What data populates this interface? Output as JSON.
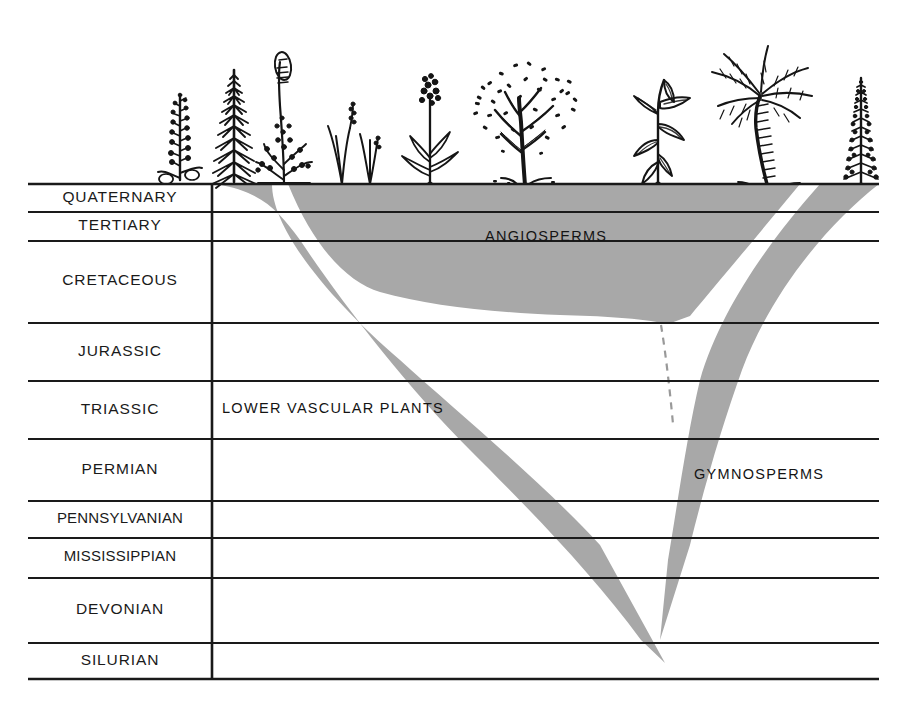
{
  "figure": {
    "kind": "geologic-time-plant-evolution-diagram",
    "background_color": "#ffffff",
    "band_color": "#a8a8a8",
    "line_color": "#1a1a1a",
    "frame": {
      "left": 28,
      "right": 879,
      "top": 183,
      "bottom": 679,
      "divider_x": 212
    }
  },
  "periods": [
    {
      "name": "QUATERNARY",
      "top": 183,
      "bottom": 212
    },
    {
      "name": "TERTIARY",
      "top": 212,
      "bottom": 241
    },
    {
      "name": "CRETACEOUS",
      "top": 241,
      "bottom": 323
    },
    {
      "name": "JURASSIC",
      "top": 323,
      "bottom": 381
    },
    {
      "name": "TRIASSIC",
      "top": 381,
      "bottom": 439
    },
    {
      "name": "PERMIAN",
      "top": 439,
      "bottom": 501
    },
    {
      "name": "PENNSYLVANIAN",
      "top": 501,
      "bottom": 538
    },
    {
      "name": "MISSISSIPPIAN",
      "top": 538,
      "bottom": 578
    },
    {
      "name": "DEVONIAN",
      "top": 578,
      "bottom": 643
    },
    {
      "name": "SILURIAN",
      "top": 643,
      "bottom": 679
    }
  ],
  "group_labels": [
    {
      "text": "ANGIOSPERMS",
      "x": 485,
      "y": 228
    },
    {
      "text": "LOWER VASCULAR PLANTS",
      "x": 222,
      "y": 400
    },
    {
      "text": "GYMNOSPERMS",
      "x": 694,
      "y": 466
    }
  ],
  "plants": [
    {
      "name": "clubmoss",
      "x": 152,
      "width": 58,
      "height": 108
    },
    {
      "name": "horsetail",
      "x": 206,
      "width": 56,
      "height": 122
    },
    {
      "name": "fern",
      "x": 253,
      "width": 60,
      "height": 132
    },
    {
      "name": "grass",
      "x": 320,
      "width": 58,
      "height": 92
    },
    {
      "name": "flowering-herb",
      "x": 400,
      "width": 62,
      "height": 110
    },
    {
      "name": "broadleaf-tree",
      "x": 467,
      "width": 118,
      "height": 145
    },
    {
      "name": "maize",
      "x": 620,
      "width": 80,
      "height": 120
    },
    {
      "name": "palm-tree",
      "x": 708,
      "width": 108,
      "height": 150
    },
    {
      "name": "conifer",
      "x": 838,
      "width": 50,
      "height": 115
    }
  ],
  "branches": {
    "lower_vascular": {
      "label": "LOWER VASCULAR PLANTS",
      "top_x": 215,
      "bottom_x": 660
    },
    "angiosperms": {
      "label": "ANGIOSPERMS",
      "top_left_x": 290,
      "top_right_x": 800
    },
    "gymnosperms": {
      "label": "GYMNOSPERMS",
      "top_x": 879,
      "bottom_x": 665
    },
    "dashed_connector": {
      "from_x": 660,
      "from_y": 323,
      "to_x": 672,
      "to_y": 424
    }
  }
}
